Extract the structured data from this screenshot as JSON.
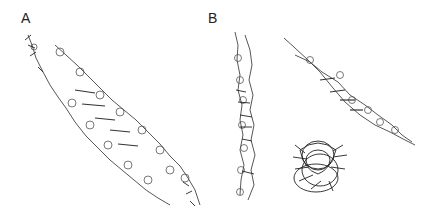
{
  "figure": {
    "panels": [
      {
        "label": "A",
        "description": "Duplex molecular structure, diagonal stick model"
      },
      {
        "label": "B",
        "description": "Three views of molecular structure: vertical side view, diagonal view, and end-on view"
      }
    ]
  }
}
